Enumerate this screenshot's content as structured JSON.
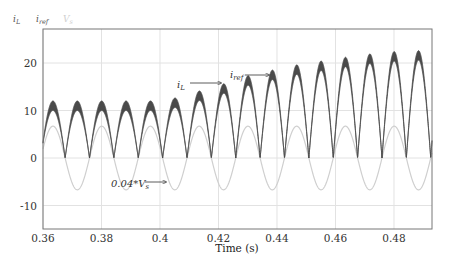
{
  "chart_data": {
    "type": "line",
    "title": "",
    "xlabel": "Time (s)",
    "ylabel": "",
    "xlim": [
      0.36,
      0.493
    ],
    "ylim": [
      -13,
      27
    ],
    "grid": true,
    "xticks": [
      0.36,
      0.38,
      0.4,
      0.42,
      0.44,
      0.46,
      0.48
    ],
    "xtick_labels": [
      "0.36",
      "0.38",
      "0.4",
      "0.42",
      "0.44",
      "0.46",
      "0.48"
    ],
    "yticks": [
      20,
      10,
      0,
      -10
    ],
    "ytick_labels": [
      "20",
      "10",
      "0",
      "-10"
    ],
    "legend": {
      "position": "top-left-outside",
      "entries": [
        {
          "label": "i_L",
          "main": "i",
          "sub": "L",
          "color": "#555555"
        },
        {
          "label": "i_ref",
          "main": "i",
          "sub": "ref",
          "color": "#555555"
        },
        {
          "label": "V_s",
          "main": "V",
          "sub": "s",
          "color": "#d0d0d0"
        }
      ]
    },
    "mains_frequency_hz": 60,
    "series": [
      {
        "name": "i_L / i_ref (rectified, with switching ripple band)",
        "color": "#4a4a4a",
        "peak_times": [
          0.3634,
          0.3717,
          0.38,
          0.3884,
          0.3967,
          0.405,
          0.4134,
          0.4217,
          0.43,
          0.4384,
          0.4467,
          0.455,
          0.4634,
          0.4717,
          0.48,
          0.4884
        ],
        "peak_values": [
          12,
          12,
          12,
          12,
          12,
          12.6,
          14.1,
          15.6,
          17.3,
          18.5,
          19.6,
          20.4,
          21.2,
          21.9,
          22.4,
          22.6
        ],
        "ripple_band": 2.0
      },
      {
        "name": "0.04*V_s",
        "color": "#cfcfcf",
        "amplitude": 6.7,
        "first_positive_peak_time": 0.3634
      }
    ],
    "annotations": [
      {
        "text_main": "i",
        "text_sub": "L",
        "arrow_to_time": 0.4217,
        "arrow_to_value": 15.6
      },
      {
        "text_main": "i",
        "text_sub": "ref",
        "arrow_to_time": 0.4384,
        "arrow_to_value": 18.3
      },
      {
        "text_main": "0.04*V",
        "text_sub": "s",
        "arrow_to_time": 0.4,
        "arrow_to_value": -6.5
      }
    ]
  }
}
